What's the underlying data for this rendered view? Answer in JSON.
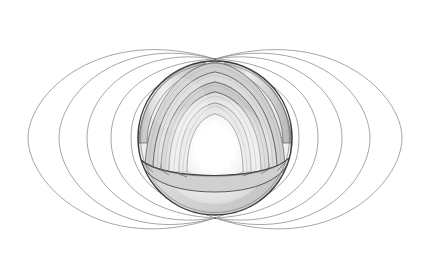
{
  "figure": {
    "title": "Earth's dipolar magnetic field with cutaway interior",
    "type": "scientific-diagram",
    "background_color": "#ffffff",
    "canvas": {
      "width": 430,
      "height": 275
    },
    "style": "grayscale pencil / line illustration, no text labels visible"
  },
  "globe": {
    "name": "Earth cutaway sphere",
    "center": {
      "x": 215,
      "y": 138
    },
    "radius": 77,
    "outline_color": "#3a3a3a",
    "surface_fill": "#d9d9d9",
    "shadow_fill": "#c2c2c2",
    "highlight_fill": "#f2f2f2",
    "cutaway_description": "Upper-front octant removed revealing concentric interior shells"
  },
  "layers": [
    {
      "name": "crust",
      "order": 1,
      "radius": 77,
      "fill": "#d8d8d8",
      "stroke": "#4a4a4a"
    },
    {
      "name": "upper-mantle",
      "order": 2,
      "radius": 70,
      "fill": "#cfcfcf",
      "stroke": "#555555"
    },
    {
      "name": "lower-mantle",
      "order": 3,
      "radius": 62,
      "fill": "#dcdcdc",
      "stroke": "#5a5a5a"
    },
    {
      "name": "outer-core",
      "order": 4,
      "radius": 50,
      "fill": "#e8e8e8",
      "stroke": "#636363"
    },
    {
      "name": "inner-core",
      "order": 5,
      "radius": 30,
      "fill": "#ffffff",
      "stroke": "#8a8a8a",
      "glow": true
    }
  ],
  "continents": [
    {
      "name": "south-america",
      "hemisphere": "lower-front",
      "stroke": "#4a4a4a"
    },
    {
      "name": "africa",
      "hemisphere": "lower-right",
      "stroke": "#4a4a4a"
    },
    {
      "name": "north-polar-landmass",
      "hemisphere": "upper-rim",
      "stroke": "#4a4a4a"
    }
  ],
  "magnetic_field": {
    "name": "dipole field lines",
    "line_color": "#8e8e8e",
    "line_width": 0.8,
    "north_pole": {
      "x": 215,
      "y": 59
    },
    "south_pole": {
      "x": 215,
      "y": 218
    },
    "loop_count_per_side": 5,
    "left_loops": [
      {
        "index": 1,
        "equator_x": 131,
        "apex_top_y": 78,
        "apex_bottom_y": 199
      },
      {
        "index": 2,
        "equator_x": 111,
        "apex_top_y": 62,
        "apex_bottom_y": 215
      },
      {
        "index": 3,
        "equator_x": 87,
        "apex_top_y": 46,
        "apex_bottom_y": 231
      },
      {
        "index": 4,
        "equator_x": 59,
        "apex_top_y": 34,
        "apex_bottom_y": 245
      },
      {
        "index": 5,
        "equator_x": 28,
        "apex_top_y": 24,
        "apex_bottom_y": 257
      }
    ],
    "right_loops": [
      {
        "index": 1,
        "equator_x": 299,
        "apex_top_y": 78,
        "apex_bottom_y": 199
      },
      {
        "index": 2,
        "equator_x": 318,
        "apex_top_y": 62,
        "apex_bottom_y": 215
      },
      {
        "index": 3,
        "equator_x": 342,
        "apex_top_y": 46,
        "apex_bottom_y": 231
      },
      {
        "index": 4,
        "equator_x": 370,
        "apex_top_y": 34,
        "apex_bottom_y": 245
      },
      {
        "index": 5,
        "equator_x": 402,
        "apex_top_y": 24,
        "apex_bottom_y": 257
      }
    ]
  },
  "chart_data": {
    "type": "scatter",
    "title": "Earth's dipolar magnetic field with cutaway interior",
    "xlabel": "",
    "ylabel": "",
    "xlim": [
      0,
      430
    ],
    "ylim": [
      0,
      275
    ],
    "grid": false,
    "legend": "none",
    "annotations": []
  }
}
